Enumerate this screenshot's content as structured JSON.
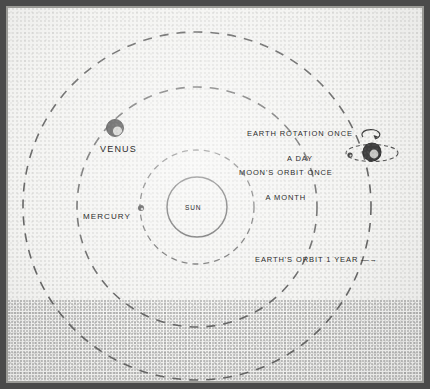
{
  "figure": {
    "paper_color": "#f2f2f0",
    "ink_color": "#2c2c2c"
  },
  "bodies": {
    "sun": {
      "label": "SUN",
      "cx": 197,
      "cy": 207,
      "r": 30
    },
    "mercury": {
      "label": "MERCURY",
      "cx": 141,
      "cy": 208,
      "r": 3
    },
    "venus": {
      "label": "VENUS",
      "cx": 115,
      "cy": 128,
      "r": 8.5
    },
    "earth": {
      "cx": 372,
      "cy": 152,
      "r": 9
    },
    "moon": {
      "cx": 352,
      "cy": 155,
      "r": 2.6
    }
  },
  "orbits": {
    "mercury": {
      "cx": 197,
      "cy": 207,
      "r": 57
    },
    "venus": {
      "cx": 197,
      "cy": 207,
      "r": 120
    },
    "earth": {
      "cx": 197,
      "cy": 206,
      "r": 174
    },
    "moon": {
      "rx": 26,
      "ry": 8.5
    }
  },
  "annotations": {
    "earth_rotation": {
      "line1": "EARTH ROTATION ONCE",
      "line2": "A DAY"
    },
    "moon_orbit": {
      "line1": "MOON'S ORBIT ONCE",
      "line2": "A MONTH"
    },
    "earth_orbit": {
      "text": "EARTH'S ORBIT 1 YEAR —→"
    }
  }
}
